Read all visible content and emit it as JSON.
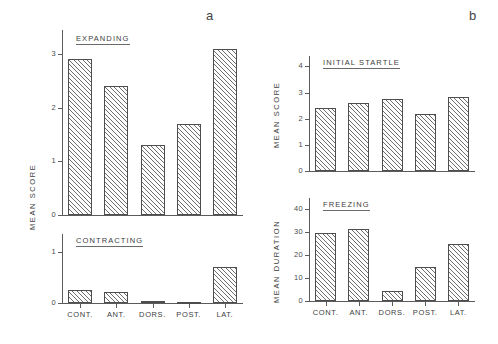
{
  "figure": {
    "panel_a_letter": "a",
    "panel_b_letter": "b"
  },
  "chart_data": [
    {
      "id": "expanding",
      "type": "bar",
      "title": "EXPANDING",
      "panel": "a",
      "xlabel": "",
      "ylabel": "MEAN  SCORE",
      "categories": [
        "CONT.",
        "ANT.",
        "DORS.",
        "POST.",
        "LAT."
      ],
      "values": [
        2.9,
        2.4,
        1.3,
        1.7,
        3.1
      ],
      "ylim": [
        0,
        3.45
      ],
      "yticks": [
        0,
        1,
        2,
        3
      ],
      "ytick_labels": [
        "0",
        "1",
        "2",
        "3"
      ],
      "grid": false,
      "legend": "none",
      "hatch": "diagonal"
    },
    {
      "id": "contracting",
      "type": "bar",
      "title": "CONTRACTING",
      "panel": "a",
      "xlabel": "",
      "ylabel": "MEAN  SCORE",
      "categories": [
        "CONT.",
        "ANT.",
        "DORS.",
        "POST.",
        "LAT."
      ],
      "values": [
        0.26,
        0.22,
        0.03,
        0.02,
        0.7
      ],
      "ylim": [
        0,
        1.35
      ],
      "yticks": [
        0,
        1
      ],
      "ytick_labels": [
        "0",
        "1"
      ],
      "grid": false,
      "legend": "none",
      "hatch": "diagonal"
    },
    {
      "id": "initial-startle",
      "type": "bar",
      "title": "INITIAL   STARTLE",
      "panel": "b",
      "xlabel": "",
      "ylabel": "MEAN  SCORE",
      "categories": [
        "CONT.",
        "ANT.",
        "DORS.",
        "POST.",
        "LAT."
      ],
      "values": [
        2.4,
        2.6,
        2.75,
        2.2,
        2.85
      ],
      "ylim": [
        0,
        4.4
      ],
      "yticks": [
        0,
        1,
        2,
        3,
        4
      ],
      "ytick_labels": [
        "0",
        "1",
        "2",
        "3",
        "4"
      ],
      "grid": false,
      "legend": "none",
      "hatch": "diagonal"
    },
    {
      "id": "freezing",
      "type": "bar",
      "title": "FREEZING",
      "panel": "b",
      "xlabel": "",
      "ylabel": "MEAN  DURATION",
      "categories": [
        "CONT.",
        "ANT.",
        "DORS.",
        "POST.",
        "LAT."
      ],
      "values": [
        29.5,
        31.5,
        4.5,
        15,
        25
      ],
      "ylim": [
        0,
        45
      ],
      "yticks": [
        0,
        10,
        20,
        30,
        40
      ],
      "ytick_labels": [
        "0",
        "10",
        "20",
        "30",
        "40"
      ],
      "grid": false,
      "legend": "none",
      "hatch": "diagonal"
    }
  ],
  "colors": {
    "ink": "#4d4d4d",
    "hatch": "#6e6e6e",
    "background": "#ffffff"
  }
}
